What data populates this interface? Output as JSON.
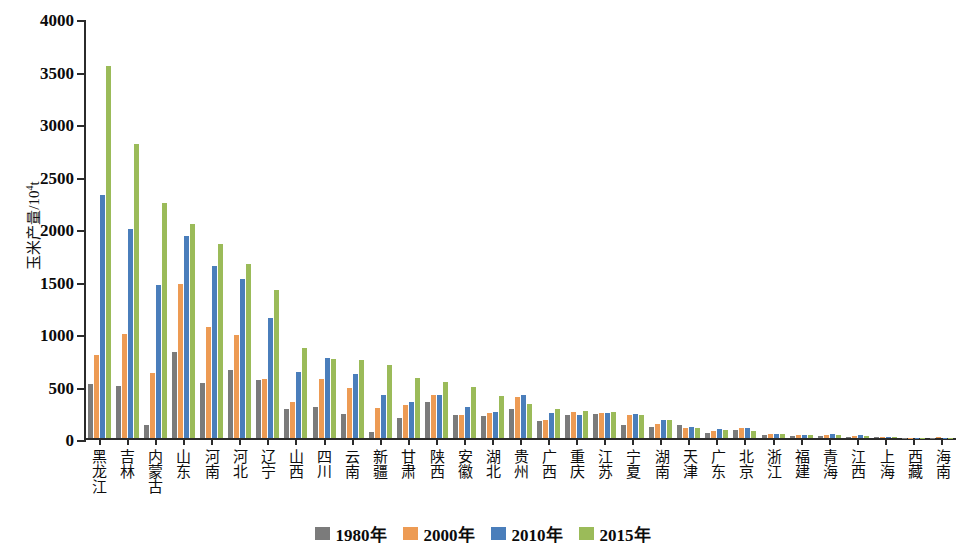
{
  "chart_data": {
    "type": "bar",
    "title": "",
    "xlabel": "",
    "ylabel": "玉米产量/10⁴t",
    "ylabel_text": "玉米产量/10",
    "ylabel_sup": "4",
    "ylabel_unit": "t",
    "ylim": [
      0,
      4000
    ],
    "yticks": [
      0,
      500,
      1000,
      1500,
      2000,
      2500,
      3000,
      3500,
      4000
    ],
    "grid": false,
    "legend_position": "bottom",
    "categories": [
      "黑龙江",
      "吉林",
      "内蒙古",
      "山东",
      "河南",
      "河北",
      "辽宁",
      "山西",
      "四川",
      "云南",
      "新疆",
      "甘肃",
      "陕西",
      "安徽",
      "湖北",
      "贵州",
      "广西",
      "重庆",
      "江苏",
      "宁夏",
      "湖南",
      "天津",
      "广东",
      "北京",
      "浙江",
      "福建",
      "青海",
      "江西",
      "上海",
      "西藏",
      "海南"
    ],
    "series": [
      {
        "name": "1980年",
        "color": "#7b7b7b",
        "values": [
          515,
          495,
          125,
          820,
          525,
          650,
          550,
          280,
          300,
          230,
          60,
          190,
          345,
          215,
          205,
          280,
          160,
          215,
          225,
          125,
          105,
          120,
          45,
          80,
          30,
          20,
          18,
          10,
          12,
          2,
          4
        ]
      },
      {
        "name": "2000年",
        "color": "#ed9b54",
        "values": [
          790,
          990,
          615,
          1465,
          1060,
          985,
          560,
          340,
          565,
          475,
          285,
          310,
          405,
          220,
          240,
          395,
          175,
          245,
          235,
          215,
          135,
          95,
          70,
          95,
          35,
          25,
          30,
          15,
          12,
          3,
          5
        ]
      },
      {
        "name": "2010年",
        "color": "#4a7ebb",
        "values": [
          2315,
          1990,
          1460,
          1920,
          1635,
          1510,
          1145,
          630,
          765,
          605,
          410,
          340,
          405,
          300,
          250,
          410,
          240,
          215,
          235,
          225,
          175,
          105,
          85,
          95,
          40,
          30,
          35,
          25,
          8,
          4,
          3
        ]
      },
      {
        "name": "2015年",
        "color": "#9bbb59",
        "values": [
          3540,
          2800,
          2240,
          2035,
          1845,
          1660,
          1405,
          855,
          755,
          745,
          700,
          570,
          530,
          490,
          400,
          325,
          275,
          255,
          250,
          215,
          175,
          100,
          80,
          70,
          35,
          25,
          25,
          22,
          6,
          3,
          2
        ]
      }
    ],
    "legend": [
      "1980年",
      "2000年",
      "2010年",
      "2015年"
    ]
  }
}
